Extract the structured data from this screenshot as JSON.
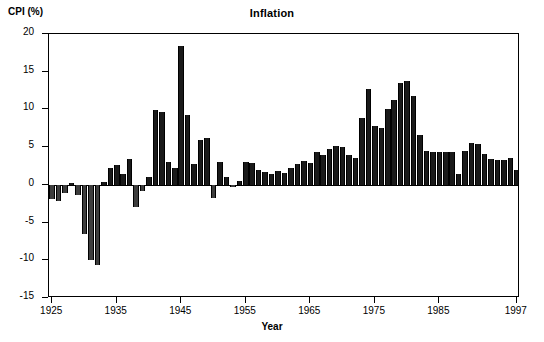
{
  "chart_data": {
    "type": "bar",
    "title": "Inflation",
    "xlabel": "Year",
    "ylabel": "CPI (%)",
    "ylim": [
      -15,
      20
    ],
    "xlim": [
      1924.5,
      1997.5
    ],
    "grid": false,
    "legend": null,
    "yticks": [
      20,
      15,
      10,
      5,
      0,
      -5,
      -10,
      -15
    ],
    "ytick_labels": [
      "20",
      "15",
      "10",
      "5",
      "0",
      "-5",
      "-10",
      "-15"
    ],
    "xticks": [
      1925,
      1935,
      1945,
      1955,
      1965,
      1975,
      1985,
      1997
    ],
    "xtick_labels": [
      "1925",
      "1935",
      "1945",
      "1955",
      "1965",
      "1975",
      "1985",
      "1997"
    ],
    "bar_color": "#1a1a1a",
    "negative_bar_color": "#3d3d3d",
    "categories": [
      1925,
      1926,
      1927,
      1928,
      1929,
      1930,
      1931,
      1932,
      1933,
      1934,
      1935,
      1936,
      1937,
      1938,
      1939,
      1940,
      1941,
      1942,
      1943,
      1944,
      1945,
      1946,
      1947,
      1948,
      1949,
      1950,
      1951,
      1952,
      1953,
      1954,
      1955,
      1956,
      1957,
      1958,
      1959,
      1960,
      1961,
      1962,
      1963,
      1964,
      1965,
      1966,
      1967,
      1968,
      1969,
      1970,
      1971,
      1972,
      1973,
      1974,
      1975,
      1976,
      1977,
      1978,
      1979,
      1980,
      1981,
      1982,
      1983,
      1984,
      1985,
      1986,
      1987,
      1988,
      1989,
      1990,
      1991,
      1992,
      1993,
      1994,
      1995,
      1996,
      1997
    ],
    "values": [
      -1.9,
      -2.2,
      -1.1,
      0.2,
      -1.3,
      -6.5,
      -9.9,
      -10.6,
      0.4,
      2.2,
      2.6,
      1.5,
      3.4,
      -3.0,
      -0.8,
      1.0,
      9.9,
      9.6,
      3.0,
      2.3,
      18.4,
      9.2,
      2.7,
      6.0,
      6.2,
      -1.8,
      3.0,
      1.1,
      -0.3,
      0.5,
      3.0,
      2.9,
      2.0,
      1.7,
      1.5,
      1.8,
      1.6,
      2.2,
      2.7,
      3.1,
      2.9,
      4.4,
      3.9,
      4.8,
      5.2,
      5.0,
      4.0,
      3.5,
      8.8,
      12.7,
      7.8,
      7.5,
      10.0,
      11.2,
      13.5,
      13.8,
      11.8,
      6.6,
      4.5,
      4.4,
      4.4,
      4.3,
      4.3,
      1.5,
      4.5,
      5.5,
      5.4,
      4.1,
      3.4,
      3.3,
      3.3,
      3.5,
      2.0
    ]
  }
}
